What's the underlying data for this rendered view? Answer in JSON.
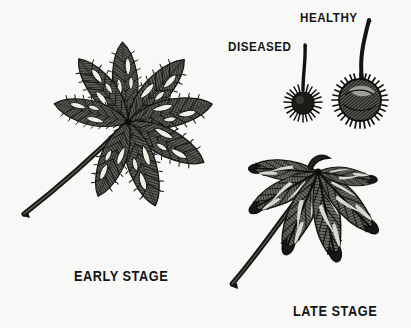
{
  "figure": {
    "background_color": "#f8f8f7",
    "ink_color": "#1a1a1a",
    "blotch_color": "#efefe8",
    "width": 411,
    "height": 328
  },
  "labels": {
    "diseased": "DISEASED",
    "healthy": "HEALTHY",
    "early_stage": "EARLY STAGE",
    "late_stage": "LATE STAGE"
  },
  "specimens": [
    {
      "id": "early-stage-leaf",
      "caption": "EARLY STAGE",
      "kind": "palmate-compound-leaf",
      "leaflet_count": 7,
      "hub": {
        "x": 128,
        "y": 122
      },
      "petiole_end": {
        "x": 22,
        "y": 216
      },
      "condition": "scattered pale necrotic blotches on green blade"
    },
    {
      "id": "diseased-burr",
      "caption": "DISEASED",
      "kind": "seed-burr",
      "center": {
        "x": 303,
        "y": 103
      },
      "radius": 13,
      "stem_top": {
        "x": 305,
        "y": 45
      },
      "condition": "undersized, shrivelled, short sparse spines"
    },
    {
      "id": "healthy-burr",
      "caption": "HEALTHY",
      "kind": "seed-burr",
      "center": {
        "x": 360,
        "y": 100
      },
      "radius": 22,
      "stem_top": {
        "x": 369,
        "y": 20
      },
      "condition": "full sized, plump, dense long spines"
    },
    {
      "id": "late-stage-leaf",
      "caption": "LATE STAGE",
      "kind": "palmate-compound-leaf",
      "leaflet_count": 6,
      "hub": {
        "x": 318,
        "y": 172
      },
      "petiole_end": {
        "x": 230,
        "y": 285
      },
      "condition": "leaflets wholly browned, curled and drooping"
    }
  ]
}
